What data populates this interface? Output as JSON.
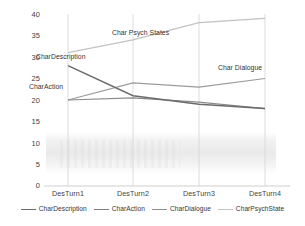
{
  "chart_data": {
    "type": "line",
    "title": "",
    "xlabel": "",
    "ylabel": "",
    "categories": [
      "DesTurn1",
      "DesTurn2",
      "DesTurn3",
      "DesTurn4"
    ],
    "ylim": [
      0,
      40
    ],
    "yticks": [
      "0",
      "5",
      "10",
      "15",
      "20",
      "25",
      "30",
      "35",
      "40"
    ],
    "grid": "vertical-only",
    "legend_position": "bottom",
    "series": [
      {
        "name": "CharDescription",
        "values": [
          28,
          21,
          19,
          18
        ],
        "color": "#808080",
        "inline_label": "CharDescription"
      },
      {
        "name": "CharAction",
        "values": [
          20,
          20.5,
          19.5,
          18
        ],
        "color": "#8c8c8c",
        "inline_label": "CharAction"
      },
      {
        "name": "CharDialogue",
        "values": [
          20,
          24,
          23,
          25
        ],
        "color": "#9a9a9a",
        "inline_label": "Char Dialogue"
      },
      {
        "name": "CharPsychState",
        "values": [
          31,
          34,
          38,
          39
        ],
        "color": "#c0c0c0",
        "inline_label": "Char Psych States"
      }
    ]
  },
  "axis": {
    "y": {
      "t0": "0",
      "t1": "5",
      "t2": "10",
      "t3": "15",
      "t4": "20",
      "t5": "25",
      "t6": "30",
      "t7": "35",
      "t8": "40"
    },
    "x": {
      "c0": "DesTurn1",
      "c1": "DesTurn2",
      "c2": "DesTurn3",
      "c3": "DesTurn4"
    }
  },
  "annotations": {
    "psych": "Char Psych States",
    "description": "CharDescription",
    "action": "CharAction",
    "dialogue": "Char Dialogue"
  },
  "legend": {
    "items": [
      {
        "label": "CharDescription",
        "color": "#6e6e6e"
      },
      {
        "label": "CharAction",
        "color": "#7f7f7f"
      },
      {
        "label": "CharDialogue",
        "color": "#8e8e8e"
      },
      {
        "label": "CharPsychState",
        "color": "#c4c4c4"
      }
    ]
  }
}
